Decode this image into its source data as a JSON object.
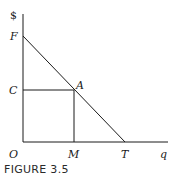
{
  "figure": {
    "caption": "FIGURE 3.5",
    "axes": {
      "y_label": "$",
      "x_label": "q",
      "origin_label": "O"
    },
    "points": {
      "F": "F",
      "C": "C",
      "A": "A",
      "M": "M",
      "T": "T"
    },
    "colors": {
      "line": "#1a1a1a",
      "background": "#ffffff"
    }
  }
}
